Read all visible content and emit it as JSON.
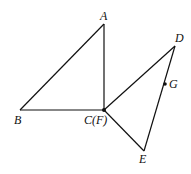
{
  "diagram": {
    "points": {
      "A": {
        "label": "A",
        "x": 104,
        "y": 24
      },
      "B": {
        "label": "B",
        "x": 20,
        "y": 110
      },
      "C": {
        "label": "C(F)",
        "x": 104,
        "y": 110
      },
      "D": {
        "label": "D",
        "x": 175,
        "y": 46
      },
      "G": {
        "label": "G",
        "x": 165,
        "y": 84
      },
      "E": {
        "label": "E",
        "x": 144,
        "y": 151
      }
    },
    "segments": [
      [
        "A",
        "B"
      ],
      [
        "A",
        "C"
      ],
      [
        "B",
        "C"
      ],
      [
        "C",
        "D"
      ],
      [
        "D",
        "E"
      ],
      [
        "C",
        "E"
      ]
    ],
    "stroke_color": "#111111"
  }
}
